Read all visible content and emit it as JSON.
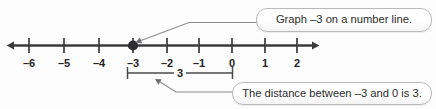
{
  "figure": {
    "background_color": "#fdfdfd",
    "line_color": "#3a3a3a",
    "point_color": "#2e2e33",
    "callout_border_color": "#b9b9bb",
    "text_color": "#242424"
  },
  "number_line": {
    "axis_label": "number-line-axis",
    "min_tick": -6,
    "max_tick": 2,
    "ticks": [
      {
        "value": -6,
        "label": "–6",
        "x": 29
      },
      {
        "value": -5,
        "label": "–5",
        "x": 64
      },
      {
        "value": -4,
        "label": "–4",
        "x": 99
      },
      {
        "value": -3,
        "label": "–3",
        "x": 133
      },
      {
        "value": -2,
        "label": "–2",
        "x": 167
      },
      {
        "value": -1,
        "label": "–1",
        "x": 199
      },
      {
        "value": 0,
        "label": "0",
        "x": 232
      },
      {
        "value": 1,
        "label": "1",
        "x": 265
      },
      {
        "value": 2,
        "label": "2",
        "x": 297
      }
    ],
    "plotted_point": {
      "value": -3,
      "label": "plotted-point-negative-three",
      "x": 133
    }
  },
  "measure": {
    "label": "3",
    "from_value": -3,
    "to_value": 0,
    "start_x": 127,
    "end_x": 232,
    "label_x": 180
  },
  "callouts": [
    {
      "id": "graph",
      "text": "Graph –3 on a number line."
    },
    {
      "id": "distance",
      "text": "The distance between –3 and 0 is 3."
    }
  ]
}
